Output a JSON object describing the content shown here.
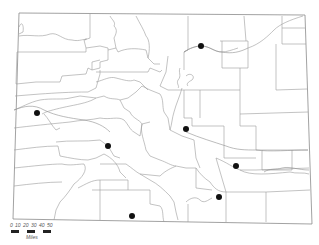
{
  "map": {
    "region": "Colorado",
    "subdivision": "counties",
    "colors": {
      "background": "#ffffff",
      "boundary": "#9a9a9a",
      "marker": "#111111"
    },
    "markers": [
      {
        "x": 201,
        "y": 46
      },
      {
        "x": 37,
        "y": 113
      },
      {
        "x": 108,
        "y": 146
      },
      {
        "x": 186,
        "y": 129
      },
      {
        "x": 236,
        "y": 166
      },
      {
        "x": 132,
        "y": 216
      },
      {
        "x": 219,
        "y": 197
      }
    ]
  },
  "scale_bar": {
    "ticks": [
      "0",
      "10",
      "20",
      "30",
      "40",
      "50"
    ],
    "unit": "Miles"
  }
}
